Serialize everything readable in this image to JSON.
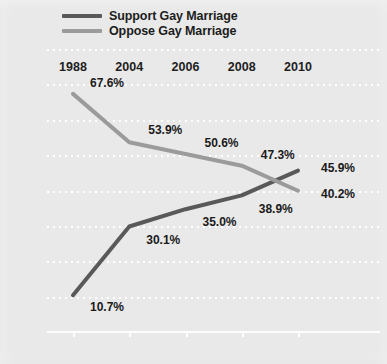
{
  "chart_data": {
    "type": "line",
    "title": "",
    "xlabel": "",
    "ylabel": "",
    "categories": [
      "1988",
      "2004",
      "2006",
      "2008",
      "2010"
    ],
    "ylim": [
      0,
      80
    ],
    "ytick_labels": [
      "0%",
      "10%",
      "20%",
      "30%",
      "40%",
      "50%",
      "60%",
      "70%",
      "80%"
    ],
    "ytick_values": [
      0,
      10,
      20,
      30,
      40,
      50,
      60,
      70,
      80
    ],
    "grid": true,
    "legend_position": "top",
    "series": [
      {
        "name": "Support Gay Marriage",
        "color": "#595959",
        "values": [
          10.7,
          30.1,
          35.0,
          38.9,
          45.9
        ],
        "labels": [
          "10.7%",
          "30.1%",
          "35.0%",
          "38.9%",
          "45.9%"
        ]
      },
      {
        "name": "Oppose Gay Marriage",
        "color": "#9b9b9b",
        "values": [
          67.6,
          53.9,
          50.6,
          47.3,
          40.2
        ],
        "labels": [
          "67.6%",
          "53.9%",
          "50.6%",
          "47.3%",
          "40.2%"
        ]
      }
    ]
  },
  "legend": {
    "items": [
      {
        "label": "Support Gay Marriage",
        "color": "#595959"
      },
      {
        "label": "Oppose Gay Marriage",
        "color": "#9b9b9b"
      }
    ]
  },
  "colors": {
    "background": "#e9e9e9",
    "gridline": "#ffffff",
    "axis": "#fdfdfd",
    "text": "#1c1c1c",
    "support": "#595959",
    "oppose": "#9b9b9b"
  }
}
